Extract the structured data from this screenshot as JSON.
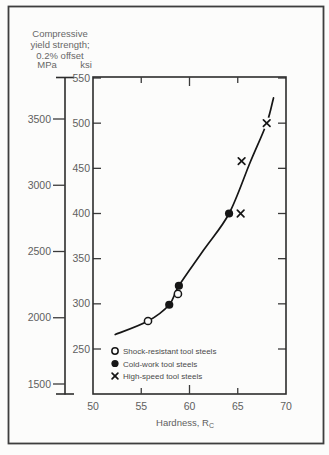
{
  "figure": {
    "title_line1": "Compressive",
    "title_line2": "yield strength;",
    "title_line3": "0.2% offset",
    "left_unit": "MPa",
    "right_unit": "ksi",
    "x_axis_label": "Hardness, R",
    "x_axis_label_sub": "C"
  },
  "colors": {
    "ink": "#161616",
    "frame": "#2c2c2c",
    "tick": "#3a3a3a",
    "border": "#3e3e3e",
    "text": "#5d5d5d",
    "background": "#fcfcfb",
    "marker_halo": "#fcfcfb"
  },
  "chart_data": {
    "type": "scatter",
    "title": "Compressive yield strength; 0.2% offset",
    "xlabel": "Hardness, RC",
    "ylabel_primary_units": "ksi",
    "ylabel_secondary_units": "MPa",
    "x_axis": {
      "min": 50,
      "max": 70,
      "ticks": [
        50,
        55,
        60,
        65,
        70
      ],
      "major_tick": 60
    },
    "y_axis_ksi": {
      "ticks": [
        550,
        500,
        450,
        400,
        350,
        300,
        250
      ],
      "top_value": 550,
      "bottom_value": 200
    },
    "y_axis_mpa": {
      "ticks": [
        3500,
        3000,
        2500,
        2000,
        1500
      ]
    },
    "grid": false,
    "legend_position": "inside-bottom-left",
    "series": [
      {
        "name": "Shock-resistant tool steels",
        "marker": "open-circle",
        "points_rc_ksi": [
          [
            55.7,
            281
          ],
          [
            58.8,
            311
          ]
        ]
      },
      {
        "name": "Cold-work tool steels",
        "marker": "filled-circle",
        "points_rc_ksi": [
          [
            57.9,
            299
          ],
          [
            58.9,
            320
          ],
          [
            64.1,
            400
          ]
        ]
      },
      {
        "name": "High-speed tool steels",
        "marker": "x",
        "points_rc_ksi": [
          [
            65.3,
            400
          ],
          [
            65.4,
            458
          ],
          [
            68.0,
            500
          ]
        ]
      }
    ],
    "trend_curve_rc_ksi": [
      [
        52.3,
        266
      ],
      [
        55.7,
        281
      ],
      [
        57.9,
        299
      ],
      [
        58.9,
        320
      ],
      [
        61.5,
        360
      ],
      [
        64.1,
        400
      ],
      [
        66.3,
        457
      ],
      [
        68.0,
        500
      ],
      [
        68.7,
        528
      ]
    ]
  }
}
